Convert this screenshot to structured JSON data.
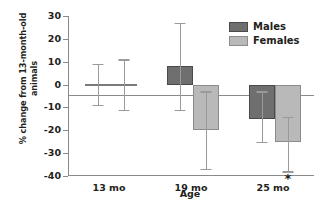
{
  "chart_data": {
    "type": "bar",
    "title": "",
    "xlabel": "Age",
    "ylabel_line1": "% change from 13-month-old",
    "ylabel_line2": "animals",
    "categories": [
      "13 mo",
      "19 mo",
      "25 mo"
    ],
    "ylim": [
      -40,
      30
    ],
    "yticks": [
      30,
      20,
      10,
      0,
      -10,
      -20,
      -30,
      -40
    ],
    "ytick_labels": [
      "30",
      "20",
      "10",
      "0",
      "-10",
      "-20",
      "-30",
      "-40"
    ],
    "grid": false,
    "legend_position": "top-right",
    "series": [
      {
        "name": "Males",
        "color": "#6f6f6f",
        "values": [
          0,
          8,
          -15
        ],
        "err_upper": [
          9,
          19,
          12
        ],
        "err_lower": [
          9,
          19,
          10
        ],
        "significance": [
          "",
          "",
          ""
        ]
      },
      {
        "name": "Females",
        "color": "#b9b9b9",
        "values": [
          0,
          -20,
          -25
        ],
        "err_upper": [
          11,
          17,
          11
        ],
        "err_lower": [
          11,
          17,
          13
        ],
        "significance": [
          "",
          "",
          "*"
        ]
      }
    ],
    "annotations": [
      {
        "text": "*",
        "category": "25 mo",
        "series": "Females",
        "meaning": "significant"
      }
    ]
  }
}
